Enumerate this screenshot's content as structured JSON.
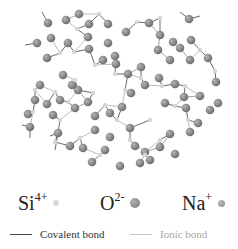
{
  "colors": {
    "si": "#d4d4d4",
    "o": "#8c8c8c",
    "na": "#9a9a9a",
    "covalent": "#4a4a4a",
    "ionic": "#c2c2c2",
    "text_dark": "#222222",
    "text_light": "#a0a0a0"
  },
  "legend": {
    "atoms": [
      {
        "symbol": "Si",
        "charge": "4+",
        "kind": "si"
      },
      {
        "symbol": "O",
        "charge": "2-",
        "kind": "o"
      },
      {
        "symbol": "Na",
        "charge": "+",
        "kind": "na"
      }
    ],
    "bonds": [
      {
        "label": "Covalent bond",
        "kind": "covalent"
      },
      {
        "label": "Ionic bond",
        "kind": "ionic"
      }
    ]
  }
}
